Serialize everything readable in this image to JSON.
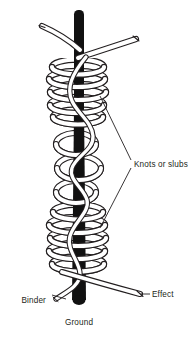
{
  "figure": {
    "background_color": "#ffffff",
    "ink_color": "#231f20",
    "ground_yarn_color": "#111111",
    "effect_yarn_fill": "#ffffff",
    "outline_color": "#231f20"
  },
  "labels": {
    "knots": "Knots or slubs",
    "binder": "Binder",
    "effect": "Effect",
    "ground": "Ground"
  },
  "components": [
    {
      "id": "ground",
      "label": "Ground",
      "description": "solid dark vertical core yarn",
      "color": "#111111"
    },
    {
      "id": "effect",
      "label": "Effect",
      "description": "white outlined yarn wrapped into coils and loops",
      "color": "#ffffff"
    },
    {
      "id": "binder",
      "label": "Binder",
      "description": "thin white yarn spiralling along the ground yarn",
      "color": "#ffffff"
    },
    {
      "id": "knots",
      "label": "Knots or slubs",
      "description": "dense coiled clusters of the effect yarn",
      "color": "#ffffff"
    }
  ],
  "annotations": {
    "knots_leader_count": 2,
    "knot_cluster_count": 2
  }
}
